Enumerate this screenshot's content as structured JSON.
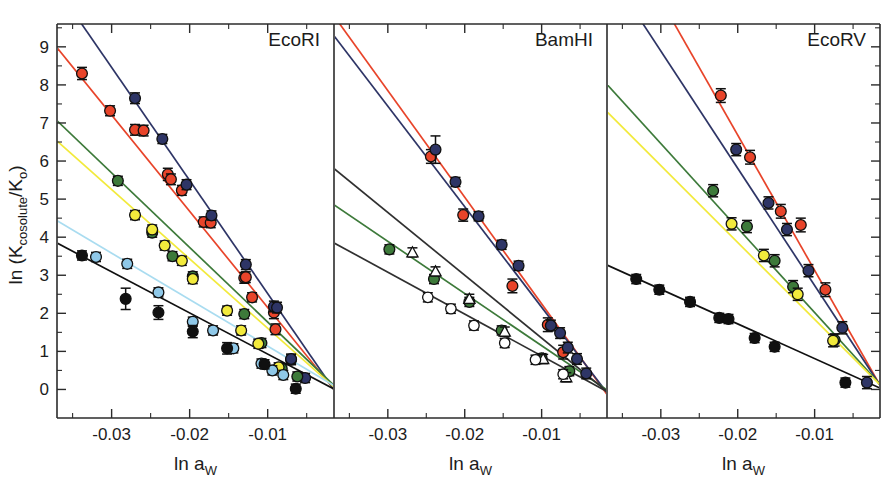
{
  "figure": {
    "type": "multi-panel-scatter",
    "width": 893,
    "height": 478,
    "background": "#ffffff"
  },
  "axes": {
    "ylabel": "ln (K",
    "ylabel_sub": "cosolute",
    "ylabel_mid": "/K",
    "ylabel_sub2": "o",
    "ylabel_end": ")",
    "ylabel_full": "ln (Kcosolute/Ko)",
    "xlabel": "ln a",
    "xlabel_sub": "W",
    "xlabel_full": "ln aW",
    "y_ticks": [
      "0",
      "1",
      "2",
      "3",
      "4",
      "5",
      "6",
      "7",
      "8",
      "9"
    ],
    "x_ticks": [
      "-0.03",
      "-0.02",
      "-0.01"
    ],
    "ylim": [
      -0.75,
      9.6
    ],
    "xlim": [
      -0.037,
      -0.0015
    ],
    "grid": false,
    "minor_ticks": true
  },
  "panels": [
    {
      "id": "ecori",
      "title": "EcoRI"
    },
    {
      "id": "bamhi",
      "title": "BamHI"
    },
    {
      "id": "ecorv",
      "title": "EcoRV"
    }
  ],
  "colors": {
    "red": "#E8442A",
    "navy": "#2E3566",
    "green": "#3D7A3A",
    "yellow": "#F2EA3C",
    "lightblue": "#8FC8E8",
    "lightblue_line": "#A9DCF0",
    "black": "#101010",
    "white": "#FFFFFF",
    "axis": "#2b2b2b"
  },
  "chart_data": {
    "type": "scatter",
    "title": "",
    "xlabel": "ln aW",
    "ylabel": "ln (Kcosolute/Ko)",
    "xlim": [
      -0.037,
      -0.0015
    ],
    "ylim": [
      -0.75,
      9.6
    ],
    "grid": false,
    "legend": "none",
    "panels": [
      {
        "name": "EcoRI",
        "series": [
          {
            "name": "red",
            "color": "#E8442A",
            "marker": "filled-circle",
            "fit": {
              "slope": -253,
              "intercept": -0.38
            },
            "points": [
              {
                "x": -0.0338,
                "y": 8.3,
                "err": 0.16
              },
              {
                "x": -0.0302,
                "y": 7.32,
                "err": 0.13
              },
              {
                "x": -0.027,
                "y": 6.82,
                "err": 0.14
              },
              {
                "x": -0.0259,
                "y": 6.8,
                "err": 0.14
              },
              {
                "x": -0.0228,
                "y": 5.65,
                "err": 0.16
              },
              {
                "x": -0.0224,
                "y": 5.52,
                "err": 0.14
              },
              {
                "x": -0.021,
                "y": 5.23,
                "err": 0.13
              },
              {
                "x": -0.0182,
                "y": 4.4,
                "err": 0.13
              },
              {
                "x": -0.0173,
                "y": 4.38,
                "err": 0.13
              },
              {
                "x": -0.013,
                "y": 2.93,
                "err": 0.14
              },
              {
                "x": -0.0128,
                "y": 2.95,
                "err": 0.14
              },
              {
                "x": -0.012,
                "y": 2.42,
                "err": 0.12
              },
              {
                "x": -0.0092,
                "y": 2.02,
                "err": 0.16
              },
              {
                "x": -0.009,
                "y": 1.58,
                "err": 0.14
              },
              {
                "x": -0.007,
                "y": 0.78,
                "err": 0.13
              }
            ]
          },
          {
            "name": "navy",
            "color": "#2E3566",
            "marker": "filled-circle",
            "fit": {
              "slope": -297,
              "intercept": -0.45
            },
            "points": [
              {
                "x": -0.027,
                "y": 7.65,
                "err": 0.14
              },
              {
                "x": -0.0235,
                "y": 6.58,
                "err": 0.12
              },
              {
                "x": -0.0204,
                "y": 5.38,
                "err": 0.13
              },
              {
                "x": -0.0172,
                "y": 4.57,
                "err": 0.12
              },
              {
                "x": -0.0128,
                "y": 3.28,
                "err": 0.13
              },
              {
                "x": -0.0092,
                "y": 2.18,
                "err": 0.14
              },
              {
                "x": -0.0088,
                "y": 2.15,
                "err": 0.14
              },
              {
                "x": -0.007,
                "y": 0.8,
                "err": 0.13
              },
              {
                "x": -0.0052,
                "y": 0.3,
                "err": 0.12
              }
            ]
          },
          {
            "name": "green",
            "color": "#3D7A3A",
            "marker": "filled-circle",
            "fit": {
              "slope": -196,
              "intercept": -0.19
            },
            "points": [
              {
                "x": -0.0292,
                "y": 5.48,
                "err": 0.12
              },
              {
                "x": -0.0248,
                "y": 4.12,
                "err": 0.12
              },
              {
                "x": -0.0222,
                "y": 3.5,
                "err": 0.12
              },
              {
                "x": -0.0196,
                "y": 2.97,
                "err": 0.12
              },
              {
                "x": -0.013,
                "y": 1.98,
                "err": 0.12
              },
              {
                "x": -0.0108,
                "y": 1.22,
                "err": 0.12
              },
              {
                "x": -0.0082,
                "y": 0.55,
                "err": 0.12
              },
              {
                "x": -0.0062,
                "y": 0.34,
                "err": 0.12
              }
            ]
          },
          {
            "name": "yellow",
            "color": "#F2EA3C",
            "marker": "filled-circle",
            "fit": {
              "slope": -182,
              "intercept": -0.21
            },
            "points": [
              {
                "x": -0.027,
                "y": 4.58,
                "err": 0.12
              },
              {
                "x": -0.0248,
                "y": 4.2,
                "err": 0.12
              },
              {
                "x": -0.0232,
                "y": 3.78,
                "err": 0.12
              },
              {
                "x": -0.021,
                "y": 3.38,
                "err": 0.12
              },
              {
                "x": -0.0196,
                "y": 2.9,
                "err": 0.12
              },
              {
                "x": -0.0152,
                "y": 2.07,
                "err": 0.12
              },
              {
                "x": -0.0134,
                "y": 1.55,
                "err": 0.12
              },
              {
                "x": -0.0112,
                "y": 1.2,
                "err": 0.12
              },
              {
                "x": -0.0086,
                "y": 0.58,
                "err": 0.12
              }
            ]
          },
          {
            "name": "lightblue",
            "color": "#8FC8E8",
            "marker": "filled-circle",
            "fit": {
              "slope": -122,
              "intercept": -0.08
            },
            "points": [
              {
                "x": -0.032,
                "y": 3.48,
                "err": 0.12
              },
              {
                "x": -0.028,
                "y": 3.3,
                "err": 0.12
              },
              {
                "x": -0.024,
                "y": 2.55,
                "err": 0.12
              },
              {
                "x": -0.0196,
                "y": 1.78,
                "err": 0.12
              },
              {
                "x": -0.017,
                "y": 1.55,
                "err": 0.12
              },
              {
                "x": -0.0144,
                "y": 1.08,
                "err": 0.12
              },
              {
                "x": -0.0108,
                "y": 0.68,
                "err": 0.12
              },
              {
                "x": -0.0094,
                "y": 0.5,
                "err": 0.12
              },
              {
                "x": -0.008,
                "y": 0.38,
                "err": 0.12
              }
            ]
          },
          {
            "name": "black",
            "color": "#101010",
            "marker": "filled-circle",
            "fit": {
              "slope": -108,
              "intercept": -0.15
            },
            "points": [
              {
                "x": -0.0338,
                "y": 3.52,
                "err": 0.12
              },
              {
                "x": -0.0282,
                "y": 2.38,
                "err": 0.28
              },
              {
                "x": -0.024,
                "y": 2.02,
                "err": 0.18
              },
              {
                "x": -0.0196,
                "y": 1.52,
                "err": 0.16
              },
              {
                "x": -0.0152,
                "y": 1.08,
                "err": 0.15
              },
              {
                "x": -0.0104,
                "y": 0.66,
                "err": 0.12
              },
              {
                "x": -0.0064,
                "y": 0.02,
                "err": 0.12
              }
            ]
          }
        ]
      },
      {
        "name": "BamHI",
        "series": [
          {
            "name": "red",
            "color": "#E8442A",
            "marker": "filled-circle",
            "fit": {
              "slope": -280,
              "intercept": -0.55
            },
            "points": [
              {
                "x": -0.0244,
                "y": 6.12,
                "err": 0.18
              },
              {
                "x": -0.0202,
                "y": 4.58,
                "err": 0.16
              },
              {
                "x": -0.0138,
                "y": 2.72,
                "err": 0.18
              },
              {
                "x": -0.0092,
                "y": 1.7,
                "err": 0.18
              },
              {
                "x": -0.0072,
                "y": 0.98,
                "err": 0.18
              }
            ]
          },
          {
            "name": "navy",
            "color": "#2E3566",
            "marker": "filled-circle",
            "fit": {
              "slope": -264,
              "intercept": -0.48
            },
            "points": [
              {
                "x": -0.0238,
                "y": 6.3,
                "err": 0.36
              },
              {
                "x": -0.0212,
                "y": 5.45,
                "err": 0.12
              },
              {
                "x": -0.0182,
                "y": 4.55,
                "err": 0.12
              },
              {
                "x": -0.0152,
                "y": 3.8,
                "err": 0.12
              },
              {
                "x": -0.013,
                "y": 3.25,
                "err": 0.12
              },
              {
                "x": -0.0088,
                "y": 1.68,
                "err": 0.14
              },
              {
                "x": -0.0076,
                "y": 1.48,
                "err": 0.14
              },
              {
                "x": -0.0066,
                "y": 1.1,
                "err": 0.14
              },
              {
                "x": -0.0054,
                "y": 0.8,
                "err": 0.14
              },
              {
                "x": -0.0042,
                "y": 0.42,
                "err": 0.14
              }
            ]
          },
          {
            "name": "green",
            "color": "#3D7A3A",
            "marker": "filled-circle",
            "fit": {
              "slope": -137,
              "intercept": -0.22
            },
            "points": [
              {
                "x": -0.0298,
                "y": 3.68,
                "err": 0.12
              },
              {
                "x": -0.024,
                "y": 2.9,
                "err": 0.12
              },
              {
                "x": -0.0194,
                "y": 2.3,
                "err": 0.12
              },
              {
                "x": -0.0152,
                "y": 1.55,
                "err": 0.12
              },
              {
                "x": -0.01,
                "y": 0.82,
                "err": 0.12
              },
              {
                "x": -0.0064,
                "y": 0.48,
                "err": 0.12
              }
            ]
          },
          {
            "name": "open-triangle",
            "color": "#FFFFFF",
            "marker": "open-triangle",
            "fit": {
              "slope": -165,
              "intercept": -0.3
            },
            "points": [
              {
                "x": -0.0268,
                "y": 3.6,
                "err": 0.12
              },
              {
                "x": -0.0238,
                "y": 3.1,
                "err": 0.12
              },
              {
                "x": -0.0194,
                "y": 2.38,
                "err": 0.12
              },
              {
                "x": -0.0148,
                "y": 1.52,
                "err": 0.12
              },
              {
                "x": -0.0098,
                "y": 0.8,
                "err": 0.12
              },
              {
                "x": -0.0068,
                "y": 0.32,
                "err": 0.12
              }
            ]
          },
          {
            "name": "open-circle",
            "color": "#FFFFFF",
            "marker": "open-circle",
            "fit": {
              "slope": -110,
              "intercept": -0.22
            },
            "points": [
              {
                "x": -0.0248,
                "y": 2.42,
                "err": 0.12
              },
              {
                "x": -0.0218,
                "y": 2.12,
                "err": 0.12
              },
              {
                "x": -0.0188,
                "y": 1.68,
                "err": 0.12
              },
              {
                "x": -0.0148,
                "y": 1.22,
                "err": 0.12
              },
              {
                "x": -0.0108,
                "y": 0.78,
                "err": 0.12
              },
              {
                "x": -0.0072,
                "y": 0.4,
                "err": 0.12
              }
            ]
          }
        ]
      },
      {
        "name": "EcoRV",
        "series": [
          {
            "name": "red",
            "color": "#E8442A",
            "marker": "filled-circle",
            "fit": {
              "slope": -355,
              "intercept": -0.42
            },
            "points": [
              {
                "x": -0.0222,
                "y": 7.72,
                "err": 0.18
              },
              {
                "x": -0.0184,
                "y": 6.1,
                "err": 0.18
              },
              {
                "x": -0.0144,
                "y": 4.68,
                "err": 0.18
              },
              {
                "x": -0.0118,
                "y": 4.32,
                "err": 0.18
              },
              {
                "x": -0.0086,
                "y": 2.62,
                "err": 0.18
              }
            ]
          },
          {
            "name": "navy",
            "color": "#2E3566",
            "marker": "filled-circle",
            "fit": {
              "slope": -308,
              "intercept": -0.35
            },
            "points": [
              {
                "x": -0.0202,
                "y": 6.3,
                "err": 0.16
              },
              {
                "x": -0.016,
                "y": 4.9,
                "err": 0.16
              },
              {
                "x": -0.0136,
                "y": 4.2,
                "err": 0.16
              },
              {
                "x": -0.0108,
                "y": 3.12,
                "err": 0.16
              },
              {
                "x": -0.0064,
                "y": 1.62,
                "err": 0.16
              },
              {
                "x": -0.0032,
                "y": 0.18,
                "err": 0.16
              }
            ]
          },
          {
            "name": "green",
            "color": "#3D7A3A",
            "marker": "filled-circle",
            "fit": {
              "slope": -222,
              "intercept": -0.2
            },
            "points": [
              {
                "x": -0.0232,
                "y": 5.22,
                "err": 0.16
              },
              {
                "x": -0.0188,
                "y": 4.28,
                "err": 0.16
              },
              {
                "x": -0.0152,
                "y": 3.38,
                "err": 0.16
              },
              {
                "x": -0.0128,
                "y": 2.7,
                "err": 0.16
              },
              {
                "x": -0.0074,
                "y": 1.3,
                "err": 0.16
              }
            ]
          },
          {
            "name": "yellow",
            "color": "#F2EA3C",
            "marker": "filled-circle",
            "fit": {
              "slope": -202,
              "intercept": -0.18
            },
            "points": [
              {
                "x": -0.0208,
                "y": 4.35,
                "err": 0.16
              },
              {
                "x": -0.0166,
                "y": 3.52,
                "err": 0.16
              },
              {
                "x": -0.0122,
                "y": 2.5,
                "err": 0.16
              },
              {
                "x": -0.0076,
                "y": 1.28,
                "err": 0.16
              }
            ]
          },
          {
            "name": "black",
            "color": "#101010",
            "marker": "filled-circle",
            "fit": {
              "slope": -91,
              "intercept": -0.1
            },
            "points": [
              {
                "x": -0.0332,
                "y": 2.9,
                "err": 0.12
              },
              {
                "x": -0.0302,
                "y": 2.62,
                "err": 0.12
              },
              {
                "x": -0.0262,
                "y": 2.3,
                "err": 0.12
              },
              {
                "x": -0.0224,
                "y": 1.88,
                "err": 0.12
              },
              {
                "x": -0.0212,
                "y": 1.85,
                "err": 0.12
              },
              {
                "x": -0.0178,
                "y": 1.35,
                "err": 0.12
              },
              {
                "x": -0.0152,
                "y": 1.12,
                "err": 0.12
              },
              {
                "x": -0.006,
                "y": 0.18,
                "err": 0.12
              }
            ]
          }
        ]
      }
    ]
  }
}
